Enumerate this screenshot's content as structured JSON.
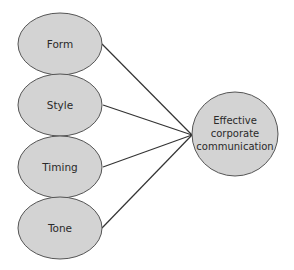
{
  "diagram": {
    "type": "converging-factors",
    "colors": {
      "node_fill": "#d3d3d3",
      "node_stroke": "#555555",
      "line": "#333333",
      "text": "#2a2a2a",
      "background": "#ffffff"
    },
    "factors": [
      {
        "label": "Form",
        "cx": 60,
        "cy": 44
      },
      {
        "label": "Style",
        "cx": 60,
        "cy": 105
      },
      {
        "label": "Timing",
        "cx": 60,
        "cy": 167
      },
      {
        "label": "Tone",
        "cx": 60,
        "cy": 228
      }
    ],
    "target": {
      "lines": [
        "Effective",
        "corporate",
        "communication"
      ],
      "cx": 235,
      "cy": 134
    },
    "convergence_point": {
      "x": 192,
      "y": 135
    }
  }
}
